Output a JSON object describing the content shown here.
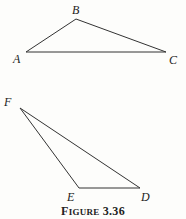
{
  "figure": {
    "caption_prefix_first": "F",
    "caption_prefix_rest": "IGURE",
    "caption_number": "3.36",
    "stroke_color": "#333333",
    "background": "#fdfdfb"
  },
  "triangles": [
    {
      "name": "ABC",
      "vertices": [
        {
          "label": "A",
          "x": 26,
          "y": 52
        },
        {
          "label": "B",
          "x": 76,
          "y": 19
        },
        {
          "label": "C",
          "x": 166,
          "y": 52
        }
      ]
    },
    {
      "name": "FED",
      "vertices": [
        {
          "label": "F",
          "x": 20,
          "y": 108
        },
        {
          "label": "E",
          "x": 79,
          "y": 188
        },
        {
          "label": "D",
          "x": 140,
          "y": 188
        }
      ]
    }
  ]
}
